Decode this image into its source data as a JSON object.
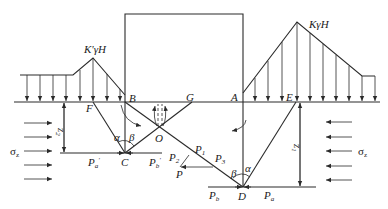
{
  "diagram": {
    "title": "",
    "load_labels": {
      "left_peak": "K'γH",
      "right_peak": "KγH"
    },
    "points": {
      "B": "B",
      "G": "G",
      "A": "A",
      "E": "E",
      "F": "F",
      "O": "O",
      "C": "C",
      "D": "D",
      "P": "P"
    },
    "forces": {
      "Pa_prime": "P",
      "Pa_prime_sub": "a",
      "Pb_prime": "P",
      "Pb_prime_sub": "b",
      "P1": "P",
      "P1_sub": "1",
      "P2": "P",
      "P2_sub": "2",
      "P3": "P",
      "P3_sub": "3",
      "Pb": "P",
      "Pb_sub": "b",
      "Pa": "P",
      "Pa_sub": "a"
    },
    "angles": {
      "alpha_left": "α",
      "beta_left": "β",
      "alpha_right": "α",
      "beta_right": "β"
    },
    "dimensions": {
      "z2": "z",
      "z2_sub": "2",
      "z1": "z",
      "z1_sub": "1"
    },
    "stress": {
      "left": "σ",
      "left_sub": "z",
      "right": "σ",
      "right_sub": "z"
    },
    "colors": {
      "line": "#2a2a2a",
      "background": "#ffffff"
    }
  }
}
